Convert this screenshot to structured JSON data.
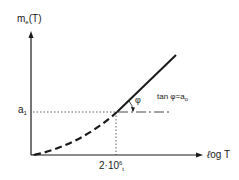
{
  "diagram": {
    "y_axis": {
      "label_main": "m",
      "label_sub": "e",
      "label_tail": "(T)"
    },
    "x_axis": {
      "label_prefix": "ℓ",
      "label_main": "og T"
    },
    "y_marker": {
      "label_main": "a",
      "label_sub": "1"
    },
    "x_marker": {
      "label_main": "2·10",
      "label_sup": "6",
      "label_sub": "t"
    },
    "angle": {
      "symbol": "φ"
    },
    "slope_annotation": {
      "text_main": "tan  φ=a",
      "text_sub": "o"
    },
    "colors": {
      "ink": "#1a1a1a",
      "background": "#ffffff"
    }
  }
}
